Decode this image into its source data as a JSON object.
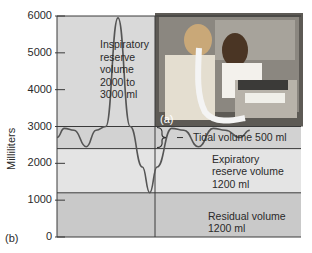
{
  "chart_data": {
    "type": "area",
    "title": "",
    "ylabel": "Milliliters",
    "xlabel": "",
    "ylim": [
      0,
      6000
    ],
    "yticks": [
      0,
      1000,
      2000,
      3000,
      4000,
      5000,
      6000
    ],
    "ytick_labels": [
      "0",
      "1000",
      "2000",
      "3000",
      "4000",
      "5000",
      "6000"
    ],
    "bands": [
      {
        "name": "Residual volume",
        "from": 0,
        "to": 1200,
        "label": "Residual volume\n1200 ml",
        "color": "#c9c9c9"
      },
      {
        "name": "Expiratory reserve volume",
        "from": 1200,
        "to": 2400,
        "label": "Expiratory\nreserve volume\n1200 ml",
        "color": "#e4e4e4"
      },
      {
        "name": "Tidal volume",
        "from": 2400,
        "to": 3000,
        "label": "Tidal volume 500 ml",
        "color": "#d2d2d2"
      },
      {
        "name": "Inspiratory reserve volume",
        "from": 3000,
        "to": 6000,
        "label": "Inspiratory\nreserve\nvolume\n2000 to\n3000 ml",
        "color": "#d9d9d9"
      }
    ],
    "trace": {
      "name": "Lung volume",
      "points": [
        [
          0,
          2700
        ],
        [
          0.03,
          2950
        ],
        [
          0.07,
          2900
        ],
        [
          0.12,
          2450
        ],
        [
          0.16,
          2900
        ],
        [
          0.2,
          3000
        ],
        [
          0.25,
          5950
        ],
        [
          0.3,
          3000
        ],
        [
          0.35,
          1900
        ],
        [
          0.38,
          1200
        ],
        [
          0.41,
          1900
        ],
        [
          0.47,
          2950
        ],
        [
          0.52,
          2900
        ],
        [
          0.58,
          2450
        ],
        [
          0.64,
          2950
        ],
        [
          0.69,
          2900
        ],
        [
          0.75,
          2700
        ],
        [
          0.79,
          2900
        ]
      ]
    },
    "panel_labels": {
      "graph": "(b)",
      "photo": "(a)"
    }
  },
  "photo": {
    "description": "Patient breathing into spirometer tube while technician operates recording device"
  }
}
